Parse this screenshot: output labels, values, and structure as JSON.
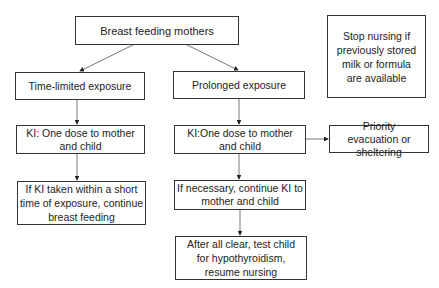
{
  "diagram": {
    "type": "flowchart",
    "nodes": {
      "root": "Breast feeding mothers",
      "time_limited": "Time-limited exposure",
      "prolonged": "Prolonged exposure",
      "note": "Stop nursing if previously stored milk or formula are available",
      "ki_left": "KI: One dose to mother and child",
      "ki_right": "KI:One dose to mother and child",
      "evacuation": "Priority evacuation or sheltering",
      "continue_bf": "If KI taken within a short time of exposure, continue breast feeding",
      "continue_ki": "If necessary, continue KI to mother and child",
      "all_clear": "After all clear, test child for hypothyroidism, resume nursing"
    },
    "edges": [
      {
        "from": "root",
        "to": "time_limited"
      },
      {
        "from": "root",
        "to": "prolonged"
      },
      {
        "from": "time_limited",
        "to": "ki_left"
      },
      {
        "from": "ki_left",
        "to": "continue_bf"
      },
      {
        "from": "prolonged",
        "to": "ki_right"
      },
      {
        "from": "ki_right",
        "to": "evacuation"
      },
      {
        "from": "ki_right",
        "to": "continue_ki"
      },
      {
        "from": "continue_ki",
        "to": "all_clear"
      }
    ]
  }
}
